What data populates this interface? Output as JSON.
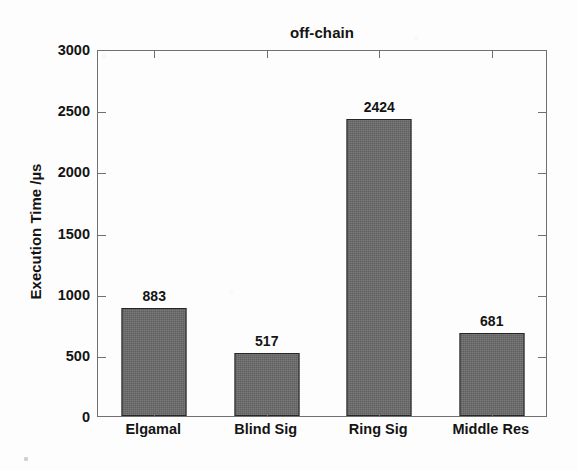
{
  "chart_data": {
    "type": "bar",
    "title": "off-chain",
    "xlabel": "",
    "ylabel": "Execution Time /µs",
    "categories": [
      "Elgamal",
      "Blind Sig",
      "Ring Sig",
      "Middle Res"
    ],
    "values": [
      883,
      517,
      2424,
      681
    ],
    "value_labels": [
      "883",
      "517",
      "2424",
      "681"
    ],
    "ylim": [
      0,
      3000
    ],
    "ytick_values": [
      0,
      500,
      1000,
      1500,
      2000,
      2500,
      3000
    ],
    "ytick_labels": [
      "0",
      "500",
      "1000",
      "1500",
      "2000",
      "2500",
      "3000"
    ],
    "grid": false,
    "legend": null,
    "series": [
      {
        "name": "off-chain",
        "values": [
          883,
          517,
          2424,
          681
        ],
        "bar_color": "#6a6a6a",
        "edge_color": "#262626"
      }
    ],
    "axes": {
      "box": true,
      "tick_direction": "in",
      "x_ticks_at_category_centers": true,
      "frame_color": "#707070"
    }
  },
  "figure": {
    "background_color": "#fdfdfd",
    "text_color": "#141414"
  }
}
